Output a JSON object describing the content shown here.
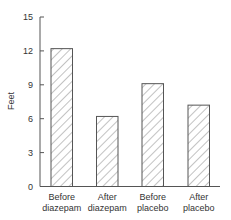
{
  "chart_data": {
    "type": "bar",
    "title": "",
    "xlabel": "",
    "ylabel": "Feet",
    "ylim": [
      0,
      15
    ],
    "yticks": [
      0,
      3,
      6,
      9,
      12,
      15
    ],
    "grid": false,
    "legend": null,
    "bar_style": "diagonal hatch",
    "categories": [
      [
        "Before",
        "diazepam"
      ],
      [
        "After",
        "diazepam"
      ],
      [
        "Before",
        "placebo"
      ],
      [
        "After",
        "placebo"
      ]
    ],
    "values": [
      12.2,
      6.2,
      9.1,
      7.2
    ]
  },
  "colors": {
    "axis": "#555555",
    "bar_stroke": "#555555",
    "hatch": "#777777",
    "text": "#333333"
  }
}
